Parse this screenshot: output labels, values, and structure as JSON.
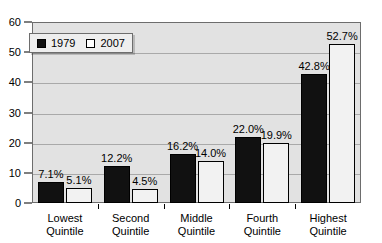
{
  "chart_data": {
    "type": "bar",
    "title": "",
    "xlabel": "",
    "ylabel": "",
    "ylim": [
      0,
      60
    ],
    "ytick_step": 10,
    "yticks": [
      "0",
      "10",
      "20",
      "30",
      "40",
      "50",
      "60"
    ],
    "grid": true,
    "legend_position": "top-left",
    "categories": [
      "Lowest Quintile",
      "Second Quintile",
      "Middle Quintile",
      "Fourth Quintile",
      "Highest Quintile"
    ],
    "category_lines": [
      [
        "Lowest",
        "Quintile"
      ],
      [
        "Second",
        "Quintile"
      ],
      [
        "Middle",
        "Quintile"
      ],
      [
        "Fourth",
        "Quintile"
      ],
      [
        "Highest",
        "Quintile"
      ]
    ],
    "series": [
      {
        "name": "1979",
        "color": "#111111",
        "values": [
          7.1,
          12.2,
          16.2,
          22.0,
          42.8
        ],
        "labels": [
          "7.1%",
          "12.2%",
          "16.2%",
          "22.0%",
          "42.8%"
        ]
      },
      {
        "name": "2007",
        "color": "#f2f2f2",
        "values": [
          5.1,
          4.5,
          14.0,
          19.9,
          52.7
        ],
        "labels": [
          "5.1%",
          "4.5%",
          "14.0%",
          "19.9%",
          "52.7%"
        ]
      }
    ]
  },
  "legend": {
    "entries": [
      {
        "label": "1979"
      },
      {
        "label": "2007"
      }
    ]
  },
  "colors": {
    "series_1979": "#111111",
    "series_2007": "#f2f2f2",
    "plot_background": "#e2e2e2",
    "axis": "#000000",
    "gridline": "#a9a9a9"
  }
}
